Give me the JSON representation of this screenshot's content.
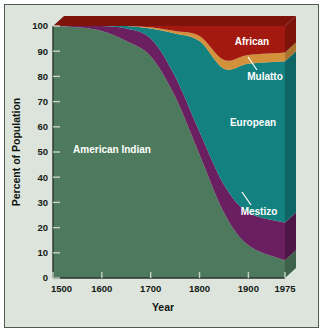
{
  "figure": {
    "background_color": "#dde4dc",
    "border_color": "#4f5a50",
    "page_color": "#ffffff"
  },
  "chart_data": {
    "type": "area",
    "stacked": true,
    "title": "",
    "xlabel": "Year",
    "ylabel": "Percent of Population",
    "x": [
      1500,
      1550,
      1600,
      1650,
      1700,
      1750,
      1800,
      1850,
      1900,
      1975
    ],
    "xlim": [
      1500,
      1975
    ],
    "ylim": [
      0,
      100
    ],
    "xticks": [
      1500,
      1600,
      1700,
      1800,
      1900,
      1975
    ],
    "xtick_labels": [
      "1500",
      "1600",
      "1700",
      "1800",
      "1900",
      "1975"
    ],
    "yticks": [
      0,
      10,
      20,
      30,
      40,
      50,
      60,
      70,
      80,
      90,
      100
    ],
    "ytick_labels": [
      "0",
      "10",
      "20",
      "30",
      "40",
      "50",
      "60",
      "70",
      "80",
      "90",
      "100"
    ],
    "grid": false,
    "legend_position": "inline-annotations",
    "series": [
      {
        "name": "American Indian",
        "color": "#4d7a5c",
        "side_color": "#3d6149",
        "values": [
          100,
          99.5,
          98,
          94,
          88,
          72,
          49,
          26,
          13,
          7
        ]
      },
      {
        "name": "Mestizo",
        "color": "#6a2060",
        "side_color": "#4d1646",
        "values": [
          0,
          0.5,
          2,
          5,
          7,
          8,
          9,
          11,
          13,
          15
        ]
      },
      {
        "name": "European",
        "color": "#12817f",
        "side_color": "#0d6665",
        "values": [
          0,
          0,
          0,
          1,
          4,
          17,
          36,
          46,
          59,
          64
        ]
      },
      {
        "name": "Mulatto",
        "color": "#d4913c",
        "side_color": "#ab742f",
        "values": [
          0,
          0,
          0,
          0,
          0.5,
          1,
          2,
          3.5,
          3.5,
          3.5
        ]
      },
      {
        "name": "African",
        "color": "#a4190f",
        "side_color": "#7d130b",
        "values": [
          0,
          0,
          0,
          0,
          0.5,
          2,
          4,
          13.5,
          11.5,
          10.5
        ]
      }
    ],
    "annotations": [
      {
        "text": "African",
        "x_px": 252,
        "y_px": 45,
        "leader": false
      },
      {
        "text": "Mulatto",
        "x_px": 265,
        "y_px": 80,
        "leader": true
      },
      {
        "text": "European",
        "x_px": 253,
        "y_px": 126,
        "leader": false
      },
      {
        "text": "Mestizo",
        "x_px": 259,
        "y_px": 215,
        "leader": true
      },
      {
        "text": "American Indian",
        "x_px": 112,
        "y_px": 153,
        "leader": false
      }
    ]
  }
}
